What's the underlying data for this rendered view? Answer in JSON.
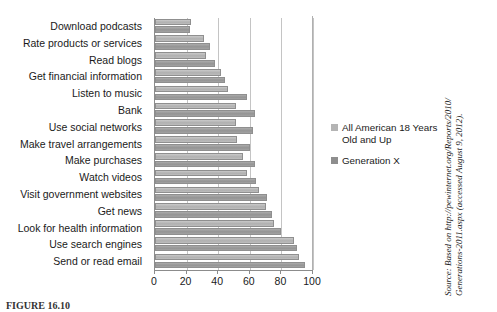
{
  "chart_data": {
    "type": "bar",
    "orientation": "horizontal",
    "title": "",
    "xlabel": "",
    "ylabel": "",
    "xlim": [
      0,
      100
    ],
    "xticks": [
      0,
      20,
      40,
      60,
      80,
      100
    ],
    "grid": true,
    "legend_position": "right",
    "categories": [
      "Download podcasts",
      "Rate products or services",
      "Read blogs",
      "Get financial information",
      "Listen to music",
      "Bank",
      "Use social networks",
      "Make travel arrangements",
      "Make purchases",
      "Watch videos",
      "Visit government websites",
      "Get news",
      "Look for health information",
      "Use search engines",
      "Send or read email"
    ],
    "series": [
      {
        "name": "All American 18 Years Old and Up",
        "color": "#b4b4b4",
        "values": [
          23,
          31,
          32,
          42,
          46,
          51,
          51,
          52,
          56,
          58,
          66,
          70,
          75,
          88,
          91
        ]
      },
      {
        "name": "Generation X",
        "color": "#8e8e8e",
        "values": [
          22,
          35,
          38,
          44,
          58,
          63,
          62,
          60,
          63,
          64,
          71,
          74,
          80,
          90,
          95
        ]
      }
    ]
  },
  "legend": {
    "entries": [
      {
        "label": "All American 18 Years\nOld and Up",
        "swatch": "light"
      },
      {
        "label": "Generation X",
        "swatch": "dark"
      }
    ]
  },
  "source_note": "Source: Based on http://pewinternet.org/Reports/2010/\nGenerations-2011.aspx (accessed August 9, 2012).",
  "caption": "FIGURE 16.10"
}
